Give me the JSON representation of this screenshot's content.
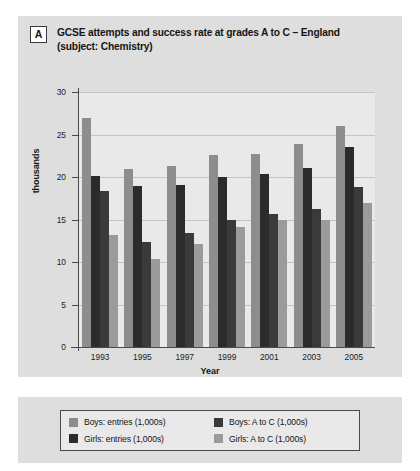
{
  "figure": {
    "badge": "A",
    "title_line1": "GCSE attempts and success rate at grades A to C – England",
    "title_line2": "(subject: Chemistry)"
  },
  "axes": {
    "ylabel": "thousands",
    "xlabel": "Year",
    "yticks": [
      "0",
      "5",
      "10",
      "15",
      "20",
      "25",
      "30"
    ]
  },
  "legend": {
    "items": [
      {
        "label": "Boys: entries (1,000s)",
        "color": "#8d8d8d"
      },
      {
        "label": "Boys: A to C (1,000s)",
        "color": "#3a3a3a"
      },
      {
        "label": "Girls: entries (1,000s)",
        "color": "#2b2b2b"
      },
      {
        "label": "Girls: A to C (1,000s)",
        "color": "#9b9b9b"
      }
    ]
  },
  "chart_data": {
    "type": "bar",
    "title": "GCSE attempts and success rate at grades A to C – England (subject: Chemistry)",
    "xlabel": "Year",
    "ylabel": "thousands",
    "ylim": [
      0,
      30
    ],
    "ytick_step": 5,
    "grid": true,
    "legend_position": "below-plot",
    "categories": [
      "1993",
      "1995",
      "1997",
      "1999",
      "2001",
      "2003",
      "2005"
    ],
    "series": [
      {
        "name": "Boys: entries (1,000s)",
        "color": "#8d8d8d",
        "values": [
          27.0,
          21.0,
          21.3,
          22.6,
          22.7,
          23.9,
          26.0
        ]
      },
      {
        "name": "Girls: entries (1,000s)",
        "color": "#2b2b2b",
        "values": [
          20.1,
          19.0,
          19.1,
          20.0,
          20.4,
          21.1,
          23.5
        ]
      },
      {
        "name": "Boys: A to C (1,000s)",
        "color": "#3a3a3a",
        "values": [
          18.4,
          12.4,
          13.4,
          15.0,
          15.6,
          16.2,
          18.8
        ]
      },
      {
        "name": "Girls: A to C (1,000s)",
        "color": "#9b9b9b",
        "values": [
          13.2,
          10.3,
          12.1,
          14.1,
          15.0,
          15.0,
          17.0
        ]
      }
    ]
  }
}
